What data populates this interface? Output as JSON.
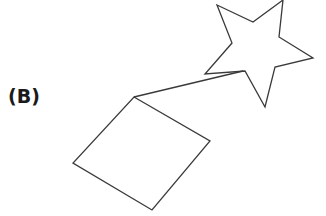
{
  "panel": {
    "label": "(B)"
  },
  "diagram": {
    "stroke_color": "#3a3a3a",
    "background": "#ffffff",
    "shapes": [
      {
        "type": "star",
        "name": "five-point-star",
        "points": "217,5 253,22 283,0 279,37 313,58 275,67 265,107 245,71 205,74 232,43"
      },
      {
        "type": "square",
        "name": "rotated-square",
        "points": "134,97 210,141 152,210 73,163"
      },
      {
        "type": "line",
        "name": "connector-line",
        "x1": 134,
        "y1": 97,
        "x2": 243,
        "y2": 71
      }
    ]
  }
}
